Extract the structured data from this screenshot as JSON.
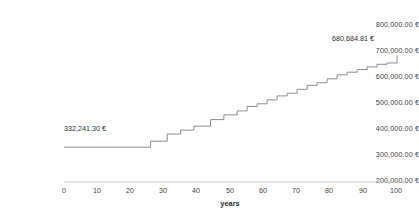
{
  "chart_data": {
    "type": "line",
    "subtype": "step-post",
    "title": "",
    "xlabel": "years",
    "ylabel": "",
    "xlim": [
      0,
      100
    ],
    "ylim": [
      200000,
      800000
    ],
    "grid": false,
    "legend": false,
    "line_color": "#808080",
    "currency_symbol": "€",
    "x_ticks": [
      0,
      10,
      20,
      30,
      40,
      50,
      60,
      70,
      80,
      90,
      100
    ],
    "x_tick_labels": [
      "0",
      "10",
      "20",
      "30",
      "40",
      "50",
      "60",
      "70",
      "80",
      "90",
      "100"
    ],
    "y_ticks": [
      200000,
      300000,
      400000,
      500000,
      600000,
      700000,
      800000
    ],
    "y_tick_labels": [
      "200,000.00 €",
      "300,000.00 €",
      "400,000.00 €",
      "500,000.00 €",
      "600,000.00 €",
      "700,000.00 €",
      "800,000.00 €"
    ],
    "annotations": [
      {
        "name": "start-value-label",
        "text": "332,241.30 €",
        "x": 2,
        "y": 332241.3
      },
      {
        "name": "end-value-label",
        "text": "680,684.81 €",
        "x": 88,
        "y": 680684.81
      }
    ],
    "x": [
      0,
      21,
      26,
      31,
      35,
      39,
      44,
      48,
      52,
      55,
      58,
      61,
      64,
      67,
      70,
      73,
      76,
      79,
      82,
      85,
      88,
      91,
      94,
      97,
      100
    ],
    "values": [
      332241.3,
      332241.3,
      355000.0,
      382000.0,
      397000.0,
      412000.0,
      437000.0,
      455000.0,
      470000.0,
      487000.0,
      497000.0,
      512000.0,
      527000.0,
      537000.0,
      552000.0,
      567000.0,
      577000.0,
      592000.0,
      607000.0,
      617000.0,
      627000.0,
      637000.0,
      647000.0,
      652000.0,
      680684.81
    ]
  }
}
